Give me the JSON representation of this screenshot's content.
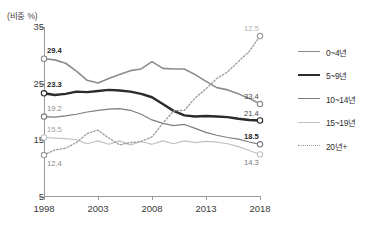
{
  "axis_unit_label": "(비중 %)",
  "legend": {
    "items": [
      {
        "label": "0~4년",
        "color": "#8c8c8c",
        "width": 1.6,
        "dash": "none"
      },
      {
        "label": "5~9년",
        "color": "#2b2b2b",
        "width": 2.4,
        "dash": "none"
      },
      {
        "label": "10~14년",
        "color": "#7d7d7d",
        "width": 1.2,
        "dash": "none"
      },
      {
        "label": "15~19년",
        "color": "#c2c2c2",
        "width": 1.2,
        "dash": "none"
      },
      {
        "label": "20년+",
        "color": "#9b9b9b",
        "width": 1.2,
        "dash": "dotted"
      }
    ]
  },
  "start_labels": [
    {
      "text": "29.4",
      "bold": true,
      "color": "#1d1d1d"
    },
    {
      "text": "23.3",
      "bold": true,
      "color": "#1d1d1d"
    },
    {
      "text": "19.2",
      "bold": false,
      "color": "#8a8a8a"
    },
    {
      "text": "15.5",
      "bold": false,
      "color": "#9e9e9e"
    },
    {
      "text": "12.4",
      "bold": false,
      "color": "#8a8a8a"
    }
  ],
  "end_labels": [
    {
      "text": "33.4",
      "bold": false,
      "color": "#4a4a4a"
    },
    {
      "text": "21.4",
      "bold": false,
      "color": "#4a4a4a"
    },
    {
      "text": "18.5",
      "bold": true,
      "color": "#1d1d1d"
    },
    {
      "text": "14.3",
      "bold": false,
      "color": "#7a7a7a"
    },
    {
      "text": "12.5",
      "bold": false,
      "color": "#b0b0b0"
    }
  ],
  "chart_data": {
    "type": "line",
    "title": "",
    "xlabel": "",
    "ylabel": "(비중 %)",
    "xlim": [
      1998,
      2018
    ],
    "ylim": [
      5,
      35
    ],
    "yticks": [
      35,
      25,
      15,
      5
    ],
    "xticks": [
      1998,
      2003,
      2008,
      2013,
      2018
    ],
    "grid": false,
    "legend_position": "right",
    "x": [
      1998,
      1999,
      2000,
      2001,
      2002,
      2003,
      2004,
      2005,
      2006,
      2007,
      2008,
      2009,
      2010,
      2011,
      2012,
      2013,
      2014,
      2015,
      2016,
      2017,
      2018
    ],
    "series": [
      {
        "name": "0~4년",
        "color": "#8c8c8c",
        "start_value": 29.4,
        "end_value": 21.4,
        "values": [
          29.4,
          29.2,
          28.6,
          27.2,
          25.6,
          25.1,
          25.9,
          26.6,
          27.3,
          27.6,
          28.9,
          27.7,
          27.6,
          27.6,
          26.6,
          25.4,
          24.3,
          23.9,
          23.2,
          22.4,
          21.4
        ]
      },
      {
        "name": "5~9년",
        "color": "#2b2b2b",
        "start_value": 23.3,
        "end_value": 18.5,
        "values": [
          23.3,
          23.0,
          23.2,
          23.6,
          23.5,
          23.7,
          23.9,
          23.8,
          23.6,
          23.2,
          22.6,
          21.4,
          20.2,
          19.4,
          19.2,
          19.3,
          19.2,
          19.1,
          18.8,
          18.6,
          18.5
        ]
      },
      {
        "name": "10~14년",
        "color": "#7d7d7d",
        "start_value": 19.2,
        "end_value": 14.3,
        "values": [
          19.2,
          19.1,
          19.3,
          19.6,
          20.0,
          20.3,
          20.5,
          20.6,
          20.3,
          19.6,
          18.6,
          18.0,
          17.6,
          17.8,
          17.1,
          16.4,
          15.9,
          15.5,
          15.2,
          14.7,
          14.3
        ]
      },
      {
        "name": "15~19년",
        "color": "#c2c2c2",
        "start_value": 15.5,
        "end_value": 12.5,
        "values": [
          15.5,
          15.4,
          15.3,
          15.1,
          14.4,
          14.9,
          14.3,
          14.9,
          14.2,
          14.8,
          14.3,
          14.9,
          14.4,
          14.9,
          14.6,
          14.8,
          14.7,
          14.4,
          13.9,
          13.2,
          12.5
        ]
      },
      {
        "name": "20년+",
        "color": "#9b9b9b",
        "start_value": 12.4,
        "end_value": 33.4,
        "values": [
          12.4,
          13.3,
          13.6,
          14.6,
          16.2,
          16.8,
          15.4,
          14.2,
          14.6,
          14.8,
          15.6,
          18.0,
          20.2,
          20.3,
          22.5,
          24.1,
          25.9,
          27.1,
          28.9,
          30.7,
          33.4
        ]
      }
    ]
  }
}
